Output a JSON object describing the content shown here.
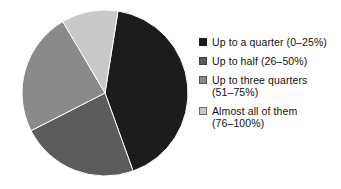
{
  "chart_data": {
    "type": "pie",
    "title": "",
    "subtitle": "",
    "xlabel": "",
    "ylabel": "",
    "grid": false,
    "legend_position": "right",
    "start_angle_deg": 9,
    "direction": "clockwise",
    "center": {
      "x": 88,
      "y": 88
    },
    "radius": 83,
    "categories": [
      "Up to a quarter (0–25%)",
      "Up to half (26–50%)",
      "Up to three quarters (51–75%)",
      "Almost all of them (76–100%)"
    ],
    "values": [
      42,
      23,
      24,
      11
    ],
    "unit": "percent",
    "slice_angles_deg": [
      151,
      83,
      87,
      39
    ],
    "colors": [
      "#1c1c1c",
      "#5c5c5c",
      "#8a8a8a",
      "#c9c9c9"
    ],
    "slice_edge_color": "#ffffff",
    "slices": [
      {
        "label": "Up to a quarter (0–25%)",
        "value": 42,
        "color": "#1c1c1c",
        "start_deg": 9,
        "end_deg": 160
      },
      {
        "label": "Up to half (26–50%)",
        "value": 23,
        "color": "#5c5c5c",
        "start_deg": 9,
        "end_deg": 92
      },
      {
        "label": "Up to three quarters (51–75%)",
        "value": 24,
        "color": "#8a8a8a",
        "start_deg": 92,
        "end_deg": 179
      },
      {
        "label": "Almost all of them (76–100%)",
        "value": 11,
        "color": "#c9c9c9",
        "start_deg": 179,
        "end_deg": 218
      }
    ]
  },
  "legend": {
    "items": [
      {
        "label": "Up to a quarter (0–25%)",
        "swatch_color": "#1c1c1c",
        "swatch_border": "#1c1c1c",
        "icon": "legend-swatch-icon"
      },
      {
        "label": "Up to half (26–50%)",
        "swatch_color": "#5c5c5c",
        "swatch_border": "#3d3d3d",
        "icon": "legend-swatch-icon"
      },
      {
        "label": "Up to three quarters\n(51–75%)",
        "swatch_color": "#8a8a8a",
        "swatch_border": "#555555",
        "icon": "legend-swatch-icon"
      },
      {
        "label": "Almost all of them\n(76–100%)",
        "swatch_color": "#c9c9c9",
        "swatch_border": "#6b6b6b",
        "icon": "legend-swatch-icon"
      }
    ]
  }
}
